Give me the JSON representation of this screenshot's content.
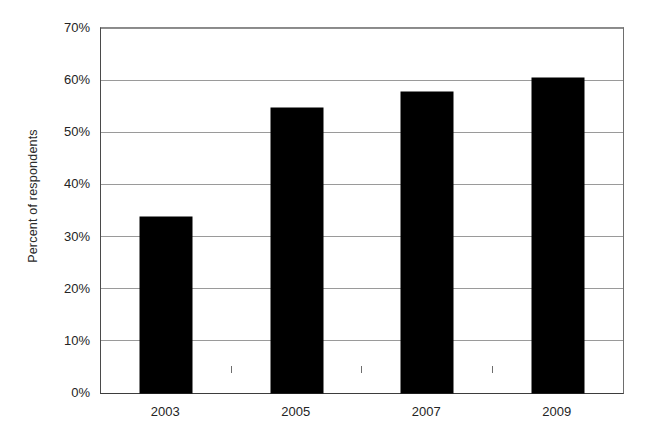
{
  "chart_data": {
    "type": "bar",
    "title": "",
    "subtitle": "",
    "xlabel": "",
    "ylabel": "Percent of respondents",
    "categories": [
      "2003",
      "2005",
      "2007",
      "2009"
    ],
    "values": [
      33.8,
      54.6,
      57.8,
      60.4
    ],
    "series": [
      {
        "name": "Percent of respondents",
        "values": [
          33.8,
          54.6,
          57.8,
          60.4
        ]
      }
    ],
    "ylim": [
      0,
      70
    ],
    "ytick_values": [
      0,
      10,
      20,
      30,
      40,
      50,
      60,
      70
    ],
    "ytick_labels": [
      "0%",
      "10%",
      "20%",
      "30%",
      "40%",
      "50%",
      "60%",
      "70%"
    ],
    "grid": true,
    "grid_axis": "y",
    "legend": false,
    "legend_position": "none",
    "bar_color": "#000000",
    "background_color": "#ffffff",
    "gridline_color": "#9a9a9a",
    "axis_color": "#3d3d3d",
    "annotations": []
  }
}
